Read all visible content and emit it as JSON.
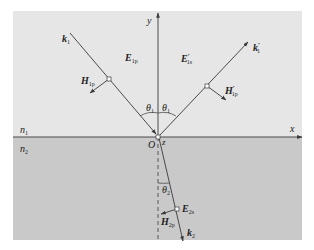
{
  "diagram": {
    "type": "oblique-incidence-p-polarized-wave",
    "colors": {
      "upper_medium": "#e6e6e6",
      "lower_medium": "#c9c9c9",
      "lines": "#3a3a3a",
      "text": "#222222"
    },
    "axes": {
      "x_label": "x",
      "y_label": "y",
      "z_label": "z",
      "origin_label": "O"
    },
    "media": {
      "upper": {
        "base": "n",
        "sub": "1"
      },
      "lower": {
        "base": "n",
        "sub": "2"
      }
    },
    "incident": {
      "k": {
        "base": "k",
        "sub": "1"
      },
      "E": {
        "base": "E",
        "sub": "1p"
      },
      "H": {
        "base": "H",
        "sub": "1p"
      },
      "angle": {
        "base": "θ",
        "sub": "1"
      }
    },
    "reflected": {
      "k": {
        "base": "k",
        "prime": "′",
        "sub": "1"
      },
      "E": {
        "base": "E",
        "prime": "′",
        "sub": "1s"
      },
      "H": {
        "base": "H",
        "prime": "′",
        "sub": "1p"
      },
      "angle": {
        "base": "θ",
        "sub": "1"
      }
    },
    "transmitted": {
      "k": {
        "base": "k",
        "sub": "2"
      },
      "E": {
        "base": "E",
        "sub": "2s"
      },
      "H": {
        "base": "H",
        "sub": "2p"
      },
      "angle": {
        "base": "θ",
        "sub": "2"
      }
    }
  }
}
